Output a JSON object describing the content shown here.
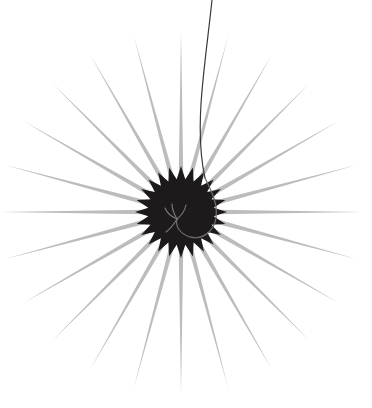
{
  "image": {
    "width": 372,
    "height": 408,
    "background_color": "#ffffff",
    "subject_name": "radiating starburst seed head",
    "caption": ""
  },
  "figure": {
    "center_x": 181,
    "center_y": 212,
    "rays": {
      "count": 24,
      "color": "#bcbcbc",
      "inner_radius": 36,
      "outer_radius": 182,
      "half_width_deg": 3.6,
      "start_angle_deg": -90,
      "name": "ray-spikes"
    },
    "core": {
      "points": 24,
      "color": "#1c1a1a",
      "outer_radius": 46,
      "inner_radius": 33,
      "start_angle_deg": -90,
      "name": "dark-spiky-core"
    },
    "stem": {
      "color": "#3a3a3a",
      "width": 1.2,
      "path": "M 212 0 C 208 38 203 72 201 104 C 199 136 201 160 205 178",
      "name": "stem-wire"
    },
    "curl": {
      "color": "#6e6a66",
      "width": 1.3,
      "path": "M 205 178 C 212 192 218 204 216 218 C 214 232 202 240 190 237 C 180 234 175 226 177 219",
      "name": "curl-hook"
    },
    "tendril": {
      "color": "#7a7672",
      "width": 1.2,
      "paths": [
        "M 177 219 C 174 214 172 209 172 204",
        "M 177 219 C 172 217 167 213 165 208",
        "M 177 219 C 182 215 185 210 186 205",
        "M 177 219 C 174 224 170 229 166 232"
      ],
      "name": "forked-tendril"
    }
  }
}
